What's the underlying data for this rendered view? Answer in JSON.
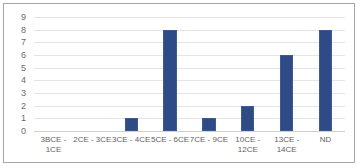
{
  "chart_data": {
    "type": "bar",
    "title": "",
    "subtitle": "",
    "xlabel": "",
    "ylabel": "",
    "categories": [
      "3BCE - 1CE",
      "2CE - 3CE",
      "3CE - 4CE",
      "5CE - 6CE",
      "7CE - 9CE",
      "10CE -\n12CE",
      "13CE -\n14CE",
      "ND"
    ],
    "values": [
      0,
      0,
      1,
      8,
      1,
      2,
      6,
      8
    ],
    "ylim": [
      0,
      9
    ],
    "ytick_labels": [
      "9",
      "8",
      "7",
      "6",
      "5",
      "4",
      "3",
      "2",
      "1",
      "0"
    ],
    "ytick_values": [
      9,
      8,
      7,
      6,
      5,
      4,
      3,
      2,
      1,
      0
    ],
    "grid": true,
    "legend": false,
    "legend_position": "none",
    "series": [
      {
        "name": "",
        "values": [
          0,
          0,
          1,
          8,
          1,
          2,
          6,
          8
        ]
      }
    ],
    "colors": {
      "bar": "#2e4b85",
      "bar_border": "#3d5a94",
      "gridline": "#e4e4e4",
      "axis_text": "#6b6b6b",
      "frame_border": "#a6a6a6",
      "background": "#ffffff"
    }
  }
}
